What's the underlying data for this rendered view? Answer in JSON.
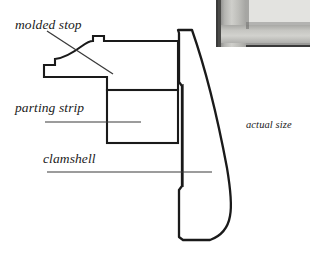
{
  "figure": {
    "scale_note": "actual size"
  },
  "labels": {
    "molded_stop": "molded stop",
    "parting_strip": "parting strip",
    "clamshell": "clamshell",
    "actual_size": "actual size"
  },
  "colors": {
    "ink": "#1a1a1a",
    "leader": "#3a3a3a",
    "paper": "#ffffff",
    "photo_frame": "#cfcfcb",
    "photo_border": "#3a3a3a"
  },
  "parts": [
    {
      "name": "molded stop",
      "description": "profiled stop moulding with ogee curve at left tip and stepped top edge"
    },
    {
      "name": "parting strip",
      "description": "rectangular strip in section"
    },
    {
      "name": "clamshell",
      "description": "tapered clamshell casing with rounded bottom corner"
    }
  ],
  "inset": {
    "name": "photo-inset",
    "description": "photograph of an installed frame corner"
  }
}
